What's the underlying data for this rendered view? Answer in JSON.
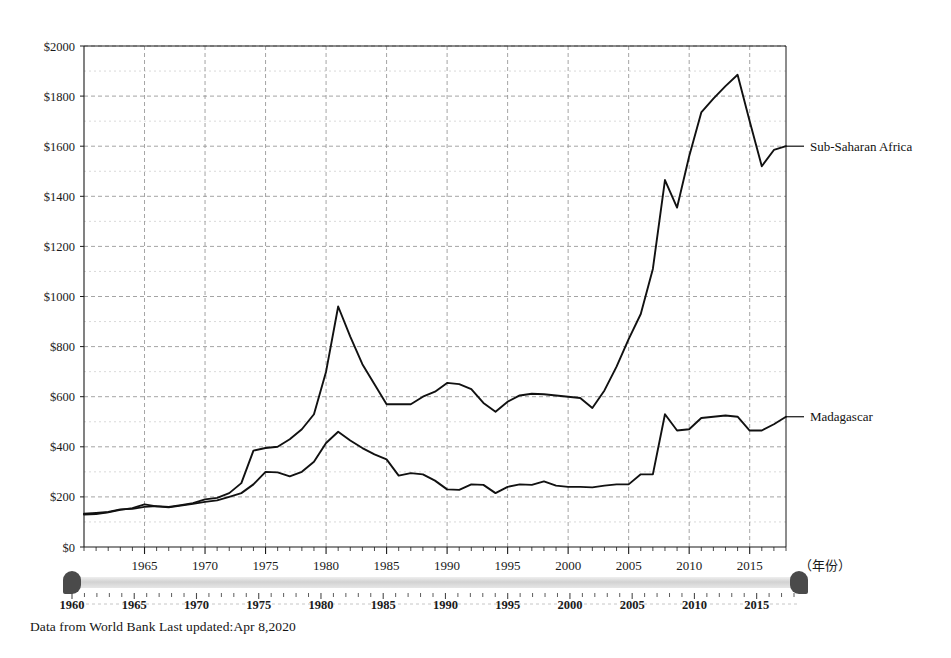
{
  "footer": {
    "text": "Data from World Bank Last updated:Apr 8,2020"
  },
  "axis": {
    "x_title": "（年份）"
  },
  "slider": {
    "min_label": "1960",
    "ticks": [
      "1960",
      "1965",
      "1970",
      "1975",
      "1980",
      "1985",
      "1990",
      "1995",
      "2000",
      "2005",
      "2010",
      "2015"
    ],
    "left_handle": "range-start-handle",
    "right_handle": "range-end-handle"
  },
  "chart_data": {
    "type": "line",
    "title": "",
    "subtitle": "",
    "xlabel": "（年份）",
    "ylabel": "",
    "xlim": [
      1960,
      2018
    ],
    "ylim": [
      0,
      2000
    ],
    "grid": true,
    "legend_position": "right-inline",
    "y_ticks": [
      0,
      200,
      400,
      600,
      800,
      1000,
      1200,
      1400,
      1600,
      1800,
      2000
    ],
    "y_tick_labels": [
      "$0",
      "$200",
      "$400",
      "$600",
      "$800",
      "$1000",
      "$1200",
      "$1400",
      "$1600",
      "$1800",
      "$2000"
    ],
    "y_minor_step": 100,
    "x_ticks": [
      1965,
      1970,
      1975,
      1980,
      1985,
      1990,
      1995,
      2000,
      2005,
      2010,
      2015
    ],
    "x_tick_labels": [
      "1965",
      "1970",
      "1975",
      "1980",
      "1985",
      "1990",
      "1995",
      "2000",
      "2005",
      "2010",
      "2015"
    ],
    "x": [
      1960,
      1961,
      1962,
      1963,
      1964,
      1965,
      1966,
      1967,
      1968,
      1969,
      1970,
      1971,
      1972,
      1973,
      1974,
      1975,
      1976,
      1977,
      1978,
      1979,
      1980,
      1981,
      1982,
      1983,
      1984,
      1985,
      1986,
      1987,
      1988,
      1989,
      1990,
      1991,
      1992,
      1993,
      1994,
      1995,
      1996,
      1997,
      1998,
      1999,
      2000,
      2001,
      2002,
      2003,
      2004,
      2005,
      2006,
      2007,
      2008,
      2009,
      2010,
      2011,
      2012,
      2013,
      2014,
      2015,
      2016,
      2017,
      2018
    ],
    "series": [
      {
        "name": "Sub-Saharan Africa",
        "color": "#111111",
        "values": [
          133,
          136,
          140,
          150,
          152,
          160,
          163,
          160,
          167,
          175,
          190,
          196,
          215,
          255,
          385,
          395,
          400,
          430,
          470,
          530,
          700,
          960,
          840,
          730,
          650,
          570,
          570,
          570,
          600,
          620,
          655,
          650,
          630,
          575,
          540,
          580,
          605,
          612,
          610,
          605,
          600,
          595,
          555,
          625,
          720,
          830,
          930,
          1110,
          1465,
          1355,
          1560,
          1735,
          1790,
          1840,
          1885,
          1700,
          1520,
          1585,
          1600
        ]
      },
      {
        "name": "Madagascar",
        "color": "#111111",
        "values": [
          130,
          132,
          138,
          148,
          155,
          170,
          162,
          158,
          165,
          172,
          180,
          186,
          200,
          215,
          250,
          300,
          298,
          282,
          300,
          340,
          415,
          460,
          425,
          395,
          370,
          350,
          285,
          295,
          290,
          265,
          230,
          228,
          250,
          248,
          215,
          240,
          250,
          248,
          262,
          245,
          240,
          240,
          238,
          245,
          250,
          250,
          290,
          290,
          530,
          465,
          470,
          515,
          520,
          525,
          520,
          465,
          465,
          490,
          520
        ]
      }
    ],
    "annotations": [
      {
        "label": "Sub-Saharan Africa",
        "x": 2018,
        "y": 1600
      },
      {
        "label": "Madagascar",
        "x": 2018,
        "y": 520
      }
    ]
  }
}
